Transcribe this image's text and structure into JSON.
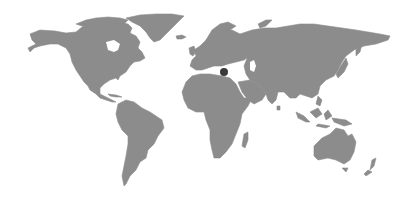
{
  "map": {
    "type": "world-silhouette",
    "projection": "miller-like",
    "land_color": "#8c8c8c",
    "background_color": "#ffffff",
    "marker": {
      "label": "",
      "region": "Eastern Mediterranean (Cyprus)",
      "x": 224,
      "y": 72,
      "radius": 4,
      "color": "#3a3a3a"
    },
    "continents": [
      "North America",
      "Greenland",
      "South America",
      "Europe",
      "Africa",
      "Asia",
      "Australia",
      "New Zealand"
    ]
  }
}
